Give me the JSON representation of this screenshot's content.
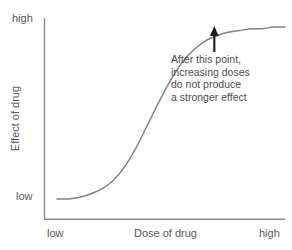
{
  "chart_data": {
    "type": "line",
    "title": "",
    "xlabel": "Dose of drug",
    "ylabel": "Effect of drug",
    "x_tick_labels": [
      "low",
      "high"
    ],
    "y_tick_labels": [
      "low",
      "high"
    ],
    "xlim": [
      "low",
      "high"
    ],
    "ylim": [
      "low",
      "high"
    ],
    "grid": false,
    "legend": "none",
    "series": [
      {
        "name": "dose-response",
        "shape": "sigmoid",
        "color": "#808285",
        "x": [
          0.0,
          0.05,
          0.1,
          0.15,
          0.2,
          0.25,
          0.3,
          0.35,
          0.4,
          0.45,
          0.5,
          0.55,
          0.6,
          0.65,
          0.7,
          0.75,
          0.8,
          0.85,
          0.9,
          0.95,
          1.0
        ],
        "y": [
          0.02,
          0.02,
          0.03,
          0.05,
          0.08,
          0.13,
          0.21,
          0.32,
          0.45,
          0.58,
          0.7,
          0.8,
          0.87,
          0.92,
          0.95,
          0.97,
          0.98,
          0.99,
          0.99,
          1.0,
          1.0
        ]
      }
    ],
    "annotations": [
      {
        "name": "plateau-callout",
        "lines": [
          "After this point,",
          "increasing doses",
          "do not produce",
          "a stronger effect"
        ],
        "arrow": {
          "points_to_x": 0.69,
          "points_to_y": 1.0,
          "direction": "up",
          "color": "#1a1a1a"
        }
      }
    ],
    "axis_color": "#808285",
    "text_color": "#58585a"
  }
}
